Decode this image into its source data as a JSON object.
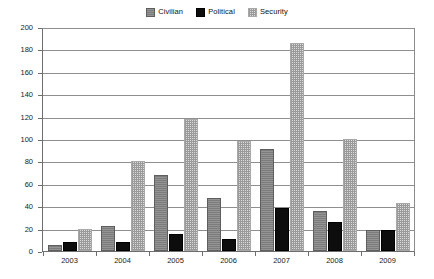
{
  "chart_data": {
    "type": "bar",
    "title": "",
    "subtitle": "",
    "xlabel": "",
    "ylabel": "",
    "categories": [
      "2003",
      "2004",
      "2005",
      "2006",
      "2007",
      "2008",
      "2009"
    ],
    "series": [
      {
        "name": "Civilian",
        "values": [
          5,
          22,
          68,
          47,
          91,
          36,
          19
        ],
        "color": "#7c7c7c",
        "pattern": "solid-gray"
      },
      {
        "name": "Political",
        "values": [
          8,
          8,
          15,
          11,
          38,
          26,
          19
        ],
        "color": "#0d0d0d",
        "pattern": "solid-black"
      },
      {
        "name": "Security",
        "values": [
          20,
          80,
          118,
          98,
          186,
          100,
          43
        ],
        "color": "#d9d9d9",
        "pattern": "dotted-light"
      }
    ],
    "ylim": [
      0,
      200
    ],
    "ytick_step": 20,
    "yticks": [
      0,
      20,
      40,
      60,
      80,
      100,
      120,
      140,
      160,
      180,
      200
    ],
    "ytick_labels": [
      "0",
      "20",
      "40",
      "60",
      "80",
      "100",
      "120",
      "140",
      "160",
      "180",
      "200"
    ],
    "grid": true,
    "grid_axis": "y",
    "legend_position": "top-center",
    "legend": [
      "Civilian",
      "Political",
      "Security"
    ],
    "annotations": []
  },
  "legend": {
    "items": [
      {
        "label": "Civilian",
        "swatch_name": "legend-swatch-civilian"
      },
      {
        "label": "Political",
        "swatch_name": "legend-swatch-political"
      },
      {
        "label": "Security",
        "swatch_name": "legend-swatch-security"
      }
    ]
  },
  "colors": {
    "civilian": "#7c7c7c",
    "political": "#0d0d0d",
    "security": "#d9d9d9",
    "grid": "#8f8f8f",
    "axis": "#6e6e6e",
    "background": "#ffffff"
  }
}
